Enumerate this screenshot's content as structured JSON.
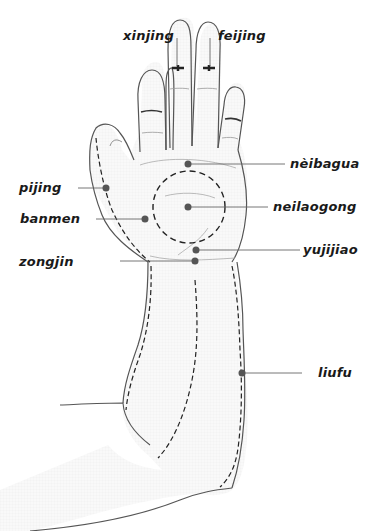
{
  "diagram": {
    "type": "acupressure-points-hand-arm",
    "colors": {
      "outline": "#555555",
      "dashed_line": "#222222",
      "point": "#555555",
      "leader_line": "#666666",
      "label_text": "#1a1a1a",
      "skin_fill": "#f7f7f7"
    },
    "labels": {
      "xinjing": "xinjing",
      "feijing": "feijing",
      "neibagua": "nèibagua",
      "neilaogong": "neilaogong",
      "pijing": "pijing",
      "banmen": "banmen",
      "yujijiao": "yujijiao",
      "zongjin": "zongjin",
      "liufu": "liufu"
    }
  }
}
